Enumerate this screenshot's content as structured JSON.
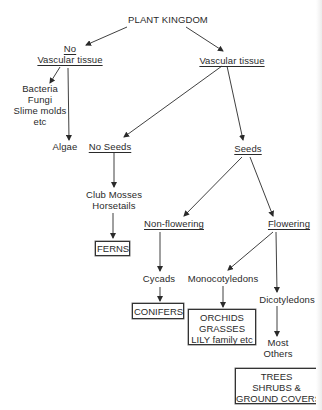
{
  "diagram": {
    "title": "PLANT KINGDOM",
    "nodes": {
      "no_vascular": {
        "lines": [
          "No",
          "Vascular tissue"
        ]
      },
      "vascular": {
        "label": "Vascular tissue"
      },
      "bacteria_group": {
        "lines": [
          "Bacteria",
          "Fungi",
          "Slime molds",
          "etc"
        ]
      },
      "algae": {
        "label": "Algae"
      },
      "no_seeds": {
        "label": "No Seeds"
      },
      "seeds": {
        "label": "Seeds"
      },
      "club_mosses": {
        "lines": [
          "Club Mosses",
          "Horsetails"
        ]
      },
      "non_flowering": {
        "label": "Non-flowering"
      },
      "flowering": {
        "label": "Flowering"
      },
      "ferns": {
        "label": "FERNS"
      },
      "cycads": {
        "label": "Cycads"
      },
      "monocotyledons": {
        "label": "Monocotyledons"
      },
      "dicotyledons": {
        "label": "Dicotyledons"
      },
      "conifers": {
        "label": "CONIFERS"
      },
      "orchids_box": {
        "lines": [
          "ORCHIDS",
          "GRASSES",
          "LILY family etc"
        ]
      },
      "most_others": {
        "lines": [
          "Most",
          "Others"
        ]
      },
      "trees_box": {
        "lines": [
          "TREES",
          "SHRUBS &",
          "GROUND COVERS"
        ]
      }
    },
    "edges": [
      [
        "PLANT KINGDOM",
        "No Vascular tissue"
      ],
      [
        "PLANT KINGDOM",
        "Vascular tissue"
      ],
      [
        "No Vascular tissue",
        "Bacteria/Fungi/Slime molds/etc"
      ],
      [
        "No Vascular tissue",
        "Algae"
      ],
      [
        "Vascular tissue",
        "No Seeds"
      ],
      [
        "Vascular tissue",
        "Seeds"
      ],
      [
        "No Seeds",
        "Club Mosses/Horsetails"
      ],
      [
        "Club Mosses/Horsetails",
        "FERNS"
      ],
      [
        "Seeds",
        "Non-flowering"
      ],
      [
        "Seeds",
        "Flowering"
      ],
      [
        "Non-flowering",
        "Cycads"
      ],
      [
        "Cycads",
        "CONIFERS"
      ],
      [
        "Flowering",
        "Monocotyledons"
      ],
      [
        "Flowering",
        "Dicotyledons"
      ],
      [
        "Monocotyledons",
        "ORCHIDS/GRASSES/LILY family etc"
      ],
      [
        "Dicotyledons",
        "Most Others"
      ]
    ],
    "colors": {
      "ink": "#2a2a2a",
      "background": "#ffffff"
    }
  }
}
